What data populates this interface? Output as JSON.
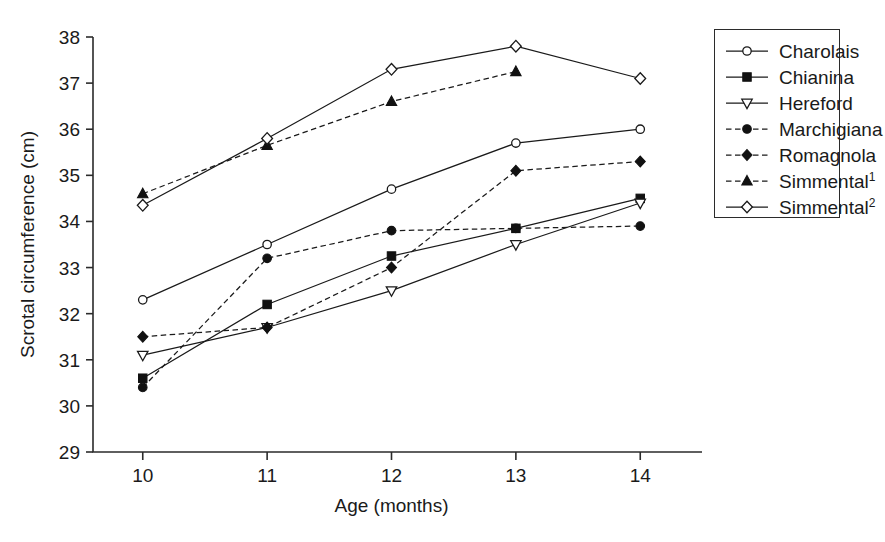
{
  "chart_data": {
    "type": "line",
    "title": "",
    "xlabel": "Age (months)",
    "ylabel": "Scrotal circumference (cm)",
    "x": [
      10,
      11,
      12,
      13,
      14
    ],
    "xticklabels": [
      "10",
      "11",
      "12",
      "13",
      "14"
    ],
    "yticklabels": [
      "29",
      "30",
      "31",
      "32",
      "33",
      "34",
      "35",
      "36",
      "37",
      "38"
    ],
    "xlim": [
      9.6,
      14.4
    ],
    "ylim": [
      29,
      38
    ],
    "grid": false,
    "legend_position": "right-outside",
    "series": [
      {
        "name": "Charolais",
        "label": "Charolais",
        "marker": "open-circle",
        "linestyle": "solid",
        "color": "#1a1a1a",
        "x": [
          10,
          11,
          12,
          13,
          14
        ],
        "values": [
          32.3,
          33.5,
          34.7,
          35.7,
          36.0
        ]
      },
      {
        "name": "Chianina",
        "label": "Chianina",
        "marker": "filled-square",
        "linestyle": "solid",
        "color": "#111111",
        "x": [
          10,
          11,
          12,
          13,
          14
        ],
        "values": [
          30.6,
          32.2,
          33.25,
          33.85,
          34.5
        ]
      },
      {
        "name": "Hereford",
        "label": "Hereford",
        "marker": "open-triangle-down",
        "linestyle": "solid",
        "color": "#1a1a1a",
        "x": [
          10,
          11,
          12,
          13,
          14
        ],
        "values": [
          31.1,
          31.7,
          32.5,
          33.5,
          34.4
        ]
      },
      {
        "name": "Marchigiana",
        "label": "Marchigiana",
        "marker": "filled-circle",
        "linestyle": "dashed",
        "color": "#111111",
        "x": [
          10,
          11,
          12,
          13,
          14
        ],
        "values": [
          30.4,
          33.2,
          33.8,
          33.85,
          33.9
        ]
      },
      {
        "name": "Romagnola",
        "label": "Romagnola",
        "marker": "filled-diamond",
        "linestyle": "dashed",
        "color": "#111111",
        "x": [
          10,
          11,
          12,
          13,
          14
        ],
        "values": [
          31.5,
          31.7,
          33.0,
          35.1,
          35.3
        ]
      },
      {
        "name": "Simmental1",
        "label": "Simmental",
        "label_sup": "1",
        "marker": "filled-triangle-up",
        "linestyle": "dashed",
        "color": "#111111",
        "x": [
          10,
          11,
          12,
          13
        ],
        "values": [
          34.6,
          35.65,
          36.6,
          37.25
        ]
      },
      {
        "name": "Simmental2",
        "label": "Simmental",
        "label_sup": "2",
        "marker": "open-diamond",
        "linestyle": "solid",
        "color": "#1a1a1a",
        "x": [
          10,
          11,
          12,
          13,
          14
        ],
        "values": [
          34.35,
          35.8,
          37.3,
          37.8,
          37.1
        ]
      }
    ]
  },
  "legend": {
    "items": [
      {
        "label": "Charolais",
        "sup": ""
      },
      {
        "label": "Chianina",
        "sup": ""
      },
      {
        "label": "Hereford",
        "sup": ""
      },
      {
        "label": "Marchigiana",
        "sup": ""
      },
      {
        "label": "Romagnola",
        "sup": ""
      },
      {
        "label": "Simmental",
        "sup": "1"
      },
      {
        "label": "Simmental",
        "sup": "2"
      }
    ]
  }
}
